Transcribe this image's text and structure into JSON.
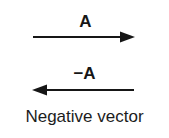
{
  "figure": {
    "caption": "Negative vector",
    "background_color": "#ffffff",
    "ink_color": "#161616",
    "vectors": [
      {
        "id": "vector-a",
        "label": "A",
        "direction": "right",
        "label_position": "above-center"
      },
      {
        "id": "vector-negative-a",
        "label": "−A",
        "direction": "left",
        "label_position": "above-center"
      }
    ]
  }
}
